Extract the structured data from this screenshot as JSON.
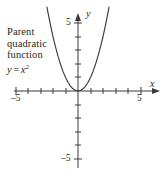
{
  "figure": {
    "background_color": "#ffffff",
    "stroke_color": "#3a3a3a",
    "text_color": "#231f20"
  },
  "annotation": {
    "line1": "Parent",
    "line2": "quadratic",
    "line3": "function",
    "equation_lhs": "y",
    "equation_op": "=",
    "equation_base": "x",
    "equation_exponent": "2"
  },
  "axes": {
    "x_label": "x",
    "y_label": "y",
    "x_tick_min_label": "–5",
    "x_tick_max_label": "5",
    "y_tick_max_label": "5",
    "y_tick_min_label": "–5"
  },
  "chart_data": {
    "type": "line",
    "subtitle": "",
    "xlabel": "x",
    "ylabel": "y",
    "xlim": [
      -5,
      5
    ],
    "ylim": [
      -5,
      5
    ],
    "xticks": [
      -5,
      -4,
      -3,
      -2,
      -1,
      0,
      1,
      2,
      3,
      4,
      5
    ],
    "yticks": [
      -5,
      -4,
      -3,
      -2,
      -1,
      0,
      1,
      2,
      3,
      4,
      5
    ],
    "xtick_labels": [
      "–5",
      "",
      "",
      "",
      "",
      "",
      "",
      "",
      "",
      "",
      "5"
    ],
    "ytick_labels": [
      "–5",
      "",
      "",
      "",
      "",
      "",
      "",
      "",
      "",
      "",
      "5"
    ],
    "grid": false,
    "legend": false,
    "legend_position": "none",
    "annotations": [
      {
        "text": "Parent quadratic function y = x²",
        "x": -4.6,
        "y": 3.6
      }
    ],
    "series": [
      {
        "name": "y = x^2",
        "equation": "y = x^2",
        "color": "#3a3a3a",
        "x": [
          -2.6,
          -2.4,
          -2.2,
          -2.0,
          -1.8,
          -1.6,
          -1.4,
          -1.2,
          -1.0,
          -0.8,
          -0.6,
          -0.4,
          -0.2,
          0.0,
          0.2,
          0.4,
          0.6,
          0.8,
          1.0,
          1.2,
          1.4,
          1.6,
          1.8,
          2.0,
          2.2,
          2.4,
          2.6
        ],
        "values": [
          6.76,
          5.76,
          4.84,
          4.0,
          3.24,
          2.56,
          1.96,
          1.44,
          1.0,
          0.64,
          0.36,
          0.16,
          0.04,
          0.0,
          0.04,
          0.16,
          0.36,
          0.64,
          1.0,
          1.44,
          1.96,
          2.56,
          3.24,
          4.0,
          4.84,
          5.76,
          6.76
        ]
      }
    ]
  }
}
